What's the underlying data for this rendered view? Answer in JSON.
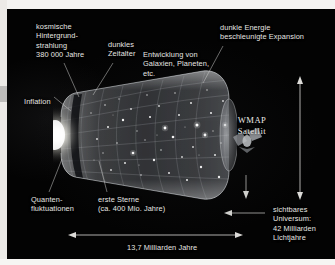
{
  "figure": {
    "title_alt": "Zeitleiste des Universums",
    "background_color": "#030303",
    "text_color": "#e7e6e3"
  },
  "labels": {
    "cmb": "kosmische\nHintergrund-\nstrahlung\n380 000 Jahre",
    "dark_age": "dunkles\nZeitalter",
    "galaxies": "Entwicklung von\nGalaxien, Planeten,\netc.",
    "dark_energy": "dunkle Energie\nbeschleunigte Expansion",
    "inflation": "Inflation",
    "wmap": "WMAP\nSatellit",
    "quantum": "Quanten-\nfluktuationen",
    "first_stars": "erste Sterne\n(ca. 400 Mio. Jahre)",
    "visible_universe": "sichtbares\nUniversum:\n42 Milliarden\nLichtjahre",
    "age": "13,7 Milliarden Jahre"
  },
  "measurements": {
    "horizontal_arrow_label": "13,7 Milliarden Jahre",
    "vertical_arrow_label": "42 Milliarden Lichtjahre"
  },
  "icons": {
    "satellite": "satellite-icon",
    "arrow_double_horizontal": "double-arrow-horizontal-icon",
    "arrow_double_vertical": "double-arrow-vertical-icon",
    "arrow_left": "arrow-left-icon",
    "arrow_down": "arrow-down-icon"
  }
}
